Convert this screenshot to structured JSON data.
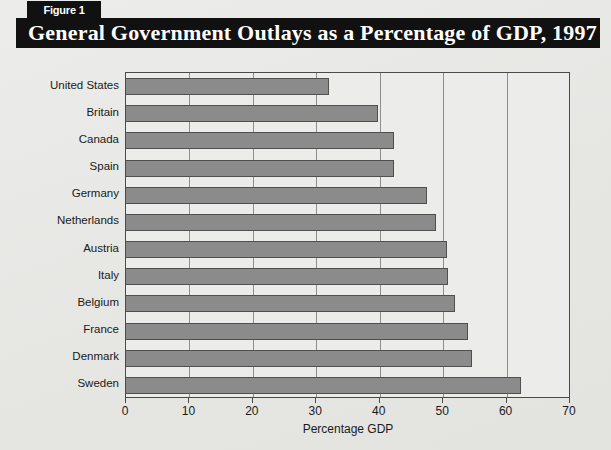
{
  "figure": {
    "badge_label": "Figure 1",
    "title": "General Government Outlays as a Percentage of GDP, 1997",
    "badge_bg": "#111111",
    "badge_fg": "#ffffff",
    "title_bg": "#111111",
    "title_fg": "#ffffff",
    "page_bg": "#e9e9e7"
  },
  "chart_data": {
    "type": "bar",
    "orientation": "horizontal",
    "title": "General Government Outlays as a Percentage of GDP, 1997",
    "xlabel": "Percentage GDP",
    "ylabel": "",
    "xlim": [
      0,
      70
    ],
    "xticks": [
      0,
      10,
      20,
      30,
      40,
      50,
      60,
      70
    ],
    "xtick_labels": [
      "0",
      "10",
      "20",
      "30",
      "40",
      "50",
      "60",
      "70"
    ],
    "grid": true,
    "grid_axis": "x",
    "legend": "none",
    "bar_color": "#8b8b8b",
    "bar_edge_color": "#4f4f4f",
    "plot_bg": "#ececea",
    "categories": [
      "United States",
      "Britain",
      "Canada",
      "Spain",
      "Germany",
      "Netherlands",
      "Austria",
      "Italy",
      "Belgium",
      "France",
      "Denmark",
      "Sweden"
    ],
    "values": [
      32.0,
      39.8,
      42.3,
      42.3,
      47.5,
      48.9,
      50.6,
      50.7,
      51.9,
      53.9,
      54.6,
      62.3
    ]
  }
}
